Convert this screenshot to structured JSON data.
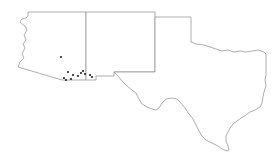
{
  "map": {
    "type": "distribution-map",
    "region": "Southwestern United States",
    "states": [
      {
        "name": "Arizona",
        "id": "az"
      },
      {
        "name": "New Mexico",
        "id": "nm"
      },
      {
        "name": "Texas",
        "id": "tx"
      }
    ],
    "colors": {
      "background": "#ffffff",
      "border": "#8a8a8a",
      "point": "#222222"
    },
    "occurrence_points": [
      {
        "x": 61,
        "y": 57
      },
      {
        "x": 68,
        "y": 72
      },
      {
        "x": 73,
        "y": 75
      },
      {
        "x": 64,
        "y": 78
      },
      {
        "x": 66,
        "y": 80
      },
      {
        "x": 71,
        "y": 79
      },
      {
        "x": 78,
        "y": 76
      },
      {
        "x": 81,
        "y": 73
      },
      {
        "x": 83,
        "y": 71
      },
      {
        "x": 85,
        "y": 74
      },
      {
        "x": 90,
        "y": 75
      },
      {
        "x": 92,
        "y": 77
      }
    ]
  }
}
